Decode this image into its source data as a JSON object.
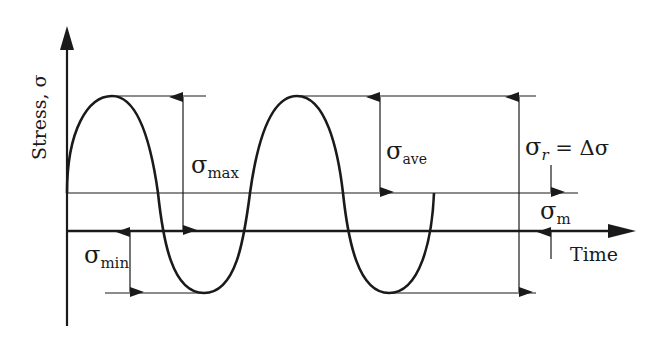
{
  "diagram": {
    "axes": {
      "y_label": "Stress, σ",
      "x_label": "Time"
    },
    "labels": {
      "sigma_max": {
        "symbol": "σ",
        "sub": "max"
      },
      "sigma_min": {
        "symbol": "σ",
        "sub": "min"
      },
      "sigma_ave": {
        "symbol": "σ",
        "sub": "ave"
      },
      "sigma_m": {
        "symbol": "σ",
        "sub": "m"
      },
      "sigma_r": {
        "symbol": "σ",
        "sub": "r",
        "eq": " = Δσ"
      }
    },
    "colors": {
      "line": "#1a1a1a",
      "background": "#ffffff"
    }
  }
}
